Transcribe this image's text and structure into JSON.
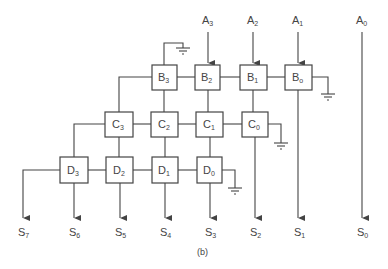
{
  "diagram": {
    "caption": "(b)",
    "inputs": [
      {
        "base": "A",
        "sub": "3",
        "x": 208
      },
      {
        "base": "A",
        "sub": "2",
        "x": 253
      },
      {
        "base": "A",
        "sub": "1",
        "x": 298
      },
      {
        "base": "A",
        "sub": "0",
        "x": 362
      }
    ],
    "outputs": [
      {
        "base": "S",
        "sub": "7",
        "x": 23
      },
      {
        "base": "S",
        "sub": "6",
        "x": 74
      },
      {
        "base": "S",
        "sub": "5",
        "x": 120
      },
      {
        "base": "S",
        "sub": "4",
        "x": 165
      },
      {
        "base": "S",
        "sub": "3",
        "x": 210
      },
      {
        "base": "S",
        "sub": "2",
        "x": 255
      },
      {
        "base": "S",
        "sub": "1",
        "x": 299
      },
      {
        "base": "S",
        "sub": "0",
        "x": 362
      }
    ],
    "rows": {
      "B": [
        {
          "base": "B",
          "sub": "3"
        },
        {
          "base": "B",
          "sub": "2"
        },
        {
          "base": "B",
          "sub": "1"
        },
        {
          "base": "B",
          "sub": "o"
        }
      ],
      "C": [
        {
          "base": "C",
          "sub": "3"
        },
        {
          "base": "C",
          "sub": "2"
        },
        {
          "base": "C",
          "sub": "1"
        },
        {
          "base": "C",
          "sub": "0"
        }
      ],
      "D": [
        {
          "base": "D",
          "sub": "3"
        },
        {
          "base": "D",
          "sub": "2"
        },
        {
          "base": "D",
          "sub": "1"
        },
        {
          "base": "D",
          "sub": "0"
        }
      ]
    },
    "colors": {
      "line": "#444444",
      "background": "#ffffff"
    }
  }
}
